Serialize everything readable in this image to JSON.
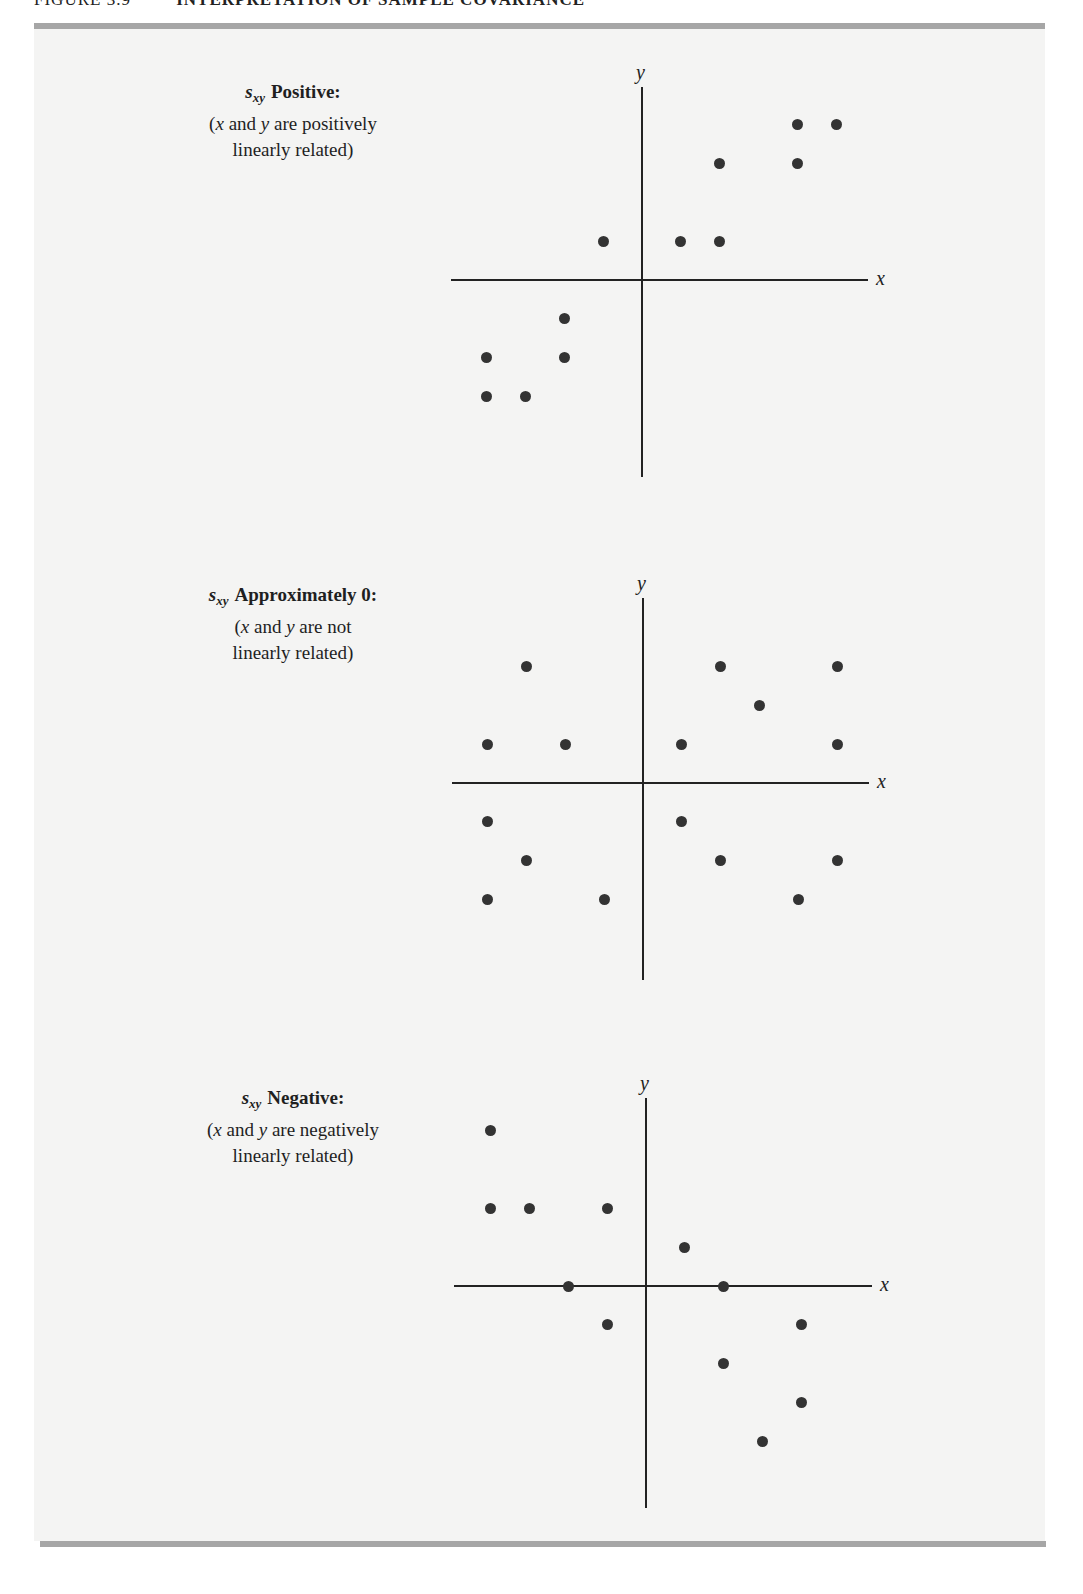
{
  "header": {
    "figure_number": "FIGURE 3.9",
    "title": "INTERPRETATION OF SAMPLE COVARIANCE"
  },
  "panels": [
    {
      "symbol": "s",
      "symbol_sub": "xy",
      "title": "Positive:",
      "line1_pre": "(",
      "line1_x": "x",
      "line1_mid": " and ",
      "line1_y": "y",
      "line1_post": " are positively",
      "line2": "linearly related)"
    },
    {
      "symbol": "s",
      "symbol_sub": "xy",
      "title": "Approximately 0:",
      "line1_pre": "(",
      "line1_x": "x",
      "line1_mid": " and ",
      "line1_y": "y",
      "line1_post": " are not",
      "line2": "linearly related)"
    },
    {
      "symbol": "s",
      "symbol_sub": "xy",
      "title": "Negative:",
      "line1_pre": "(",
      "line1_x": "x",
      "line1_mid": " and ",
      "line1_y": "y",
      "line1_post": " are negatively",
      "line2": "linearly related)"
    }
  ],
  "axes": {
    "x_label": "x",
    "y_label": "y"
  },
  "colors": {
    "dot": "#333333",
    "axis": "#222222",
    "rule": "#a6a6a6",
    "panel_bg": "#f4f4f3"
  },
  "chart_data": [
    {
      "type": "scatter",
      "title": "s_xy Positive: (x and y are positively linearly related)",
      "xlabel": "x",
      "ylabel": "y",
      "grid": false,
      "xlim": [
        -5,
        6
      ],
      "ylim": [
        -5,
        5
      ],
      "points": [
        [
          4,
          4
        ],
        [
          5,
          4
        ],
        [
          2,
          3
        ],
        [
          4,
          3
        ],
        [
          -1,
          1
        ],
        [
          1,
          1
        ],
        [
          2,
          1
        ],
        [
          -2,
          -1
        ],
        [
          -4,
          -2
        ],
        [
          -2,
          -2
        ],
        [
          -4,
          -3
        ],
        [
          -3,
          -3
        ]
      ]
    },
    {
      "type": "scatter",
      "title": "s_xy Approximately 0: (x and y are not linearly related)",
      "xlabel": "x",
      "ylabel": "y",
      "grid": false,
      "xlim": [
        -5,
        6
      ],
      "ylim": [
        -5,
        5
      ],
      "points": [
        [
          -3,
          3
        ],
        [
          2,
          3
        ],
        [
          5,
          3
        ],
        [
          3,
          2
        ],
        [
          -4,
          1
        ],
        [
          -2,
          1
        ],
        [
          1,
          1
        ],
        [
          5,
          1
        ],
        [
          -4,
          -1
        ],
        [
          1,
          -1
        ],
        [
          -3,
          -2
        ],
        [
          2,
          -2
        ],
        [
          5,
          -2
        ],
        [
          -4,
          -3
        ],
        [
          -1,
          -3
        ],
        [
          4,
          -3
        ]
      ]
    },
    {
      "type": "scatter",
      "title": "s_xy Negative: (x and y are negatively linearly related)",
      "xlabel": "x",
      "ylabel": "y",
      "grid": false,
      "xlim": [
        -5,
        6
      ],
      "ylim": [
        -5,
        5
      ],
      "points": [
        [
          -4,
          4
        ],
        [
          -4,
          2
        ],
        [
          -3,
          2
        ],
        [
          -1,
          2
        ],
        [
          1,
          1
        ],
        [
          -2,
          0
        ],
        [
          2,
          0
        ],
        [
          -1,
          -1
        ],
        [
          4,
          -1
        ],
        [
          2,
          -2
        ],
        [
          4,
          -3
        ],
        [
          3,
          -4
        ]
      ]
    }
  ]
}
